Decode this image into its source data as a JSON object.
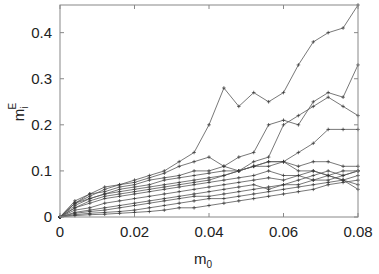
{
  "chart_data": {
    "type": "line",
    "title": "",
    "xlabel": "m_0",
    "xlabel_main": "m",
    "xlabel_sub": "0",
    "ylabel": "m_i^E",
    "ylabel_main": "m",
    "ylabel_sub": "i",
    "ylabel_sup": "E",
    "xlim": [
      0,
      0.08
    ],
    "ylim": [
      0,
      0.46
    ],
    "xticks": [
      "0",
      "0.02",
      "0.04",
      "0.06",
      "0.08"
    ],
    "xtick_values": [
      0,
      0.02,
      0.04,
      0.06,
      0.08
    ],
    "yticks": [
      "0",
      "0.1",
      "0.2",
      "0.3",
      "0.4"
    ],
    "ytick_values": [
      0,
      0.1,
      0.2,
      0.3,
      0.4
    ],
    "grid": false,
    "legend": null,
    "marker": "+",
    "line_color": "#555555",
    "x": [
      0,
      0.004,
      0.008,
      0.012,
      0.016,
      0.02,
      0.024,
      0.028,
      0.032,
      0.036,
      0.04,
      0.044,
      0.048,
      0.052,
      0.056,
      0.06,
      0.064,
      0.068,
      0.072,
      0.076,
      0.08
    ],
    "series": [
      {
        "name": "s1",
        "values": [
          0,
          0.035,
          0.05,
          0.065,
          0.07,
          0.08,
          0.09,
          0.1,
          0.12,
          0.14,
          0.2,
          0.28,
          0.24,
          0.27,
          0.25,
          0.27,
          0.33,
          0.38,
          0.4,
          0.41,
          0.46
        ]
      },
      {
        "name": "s2",
        "values": [
          0,
          0.03,
          0.045,
          0.06,
          0.07,
          0.075,
          0.085,
          0.095,
          0.11,
          0.12,
          0.13,
          0.11,
          0.13,
          0.14,
          0.2,
          0.21,
          0.2,
          0.25,
          0.27,
          0.26,
          0.33
        ]
      },
      {
        "name": "s3",
        "values": [
          0,
          0.03,
          0.05,
          0.055,
          0.065,
          0.07,
          0.08,
          0.085,
          0.09,
          0.1,
          0.1,
          0.11,
          0.1,
          0.12,
          0.13,
          0.2,
          0.22,
          0.24,
          0.26,
          0.24,
          0.22
        ]
      },
      {
        "name": "s4",
        "values": [
          0,
          0.03,
          0.04,
          0.05,
          0.06,
          0.065,
          0.07,
          0.08,
          0.085,
          0.09,
          0.095,
          0.1,
          0.1,
          0.11,
          0.12,
          0.12,
          0.14,
          0.16,
          0.19,
          0.19,
          0.19
        ]
      },
      {
        "name": "s5",
        "values": [
          0,
          0.025,
          0.04,
          0.05,
          0.055,
          0.06,
          0.065,
          0.07,
          0.075,
          0.08,
          0.085,
          0.09,
          0.1,
          0.11,
          0.12,
          0.12,
          0.11,
          0.12,
          0.12,
          0.11,
          0.11
        ]
      },
      {
        "name": "s6",
        "values": [
          0,
          0.02,
          0.035,
          0.045,
          0.05,
          0.055,
          0.06,
          0.065,
          0.07,
          0.075,
          0.08,
          0.09,
          0.1,
          0.11,
          0.11,
          0.12,
          0.1,
          0.1,
          0.09,
          0.08,
          0.07
        ]
      },
      {
        "name": "s7",
        "values": [
          0,
          0.02,
          0.03,
          0.04,
          0.045,
          0.05,
          0.055,
          0.06,
          0.065,
          0.07,
          0.075,
          0.08,
          0.085,
          0.09,
          0.1,
          0.09,
          0.09,
          0.08,
          0.09,
          0.08,
          0.06
        ]
      },
      {
        "name": "s8",
        "values": [
          0,
          0.015,
          0.02,
          0.03,
          0.035,
          0.04,
          0.045,
          0.05,
          0.055,
          0.06,
          0.065,
          0.07,
          0.075,
          0.08,
          0.085,
          0.08,
          0.09,
          0.1,
          0.09,
          0.1,
          0.1
        ]
      },
      {
        "name": "s9",
        "values": [
          0,
          0.01,
          0.015,
          0.02,
          0.025,
          0.03,
          0.035,
          0.04,
          0.045,
          0.05,
          0.055,
          0.06,
          0.065,
          0.07,
          0.06,
          0.07,
          0.08,
          0.09,
          0.1,
          0.09,
          0.1
        ]
      },
      {
        "name": "s10",
        "values": [
          0,
          0.008,
          0.012,
          0.015,
          0.02,
          0.025,
          0.03,
          0.035,
          0.04,
          0.045,
          0.045,
          0.05,
          0.055,
          0.06,
          0.065,
          0.07,
          0.07,
          0.08,
          0.08,
          0.09,
          0.1
        ]
      },
      {
        "name": "s11",
        "values": [
          0,
          0.005,
          0.008,
          0.01,
          0.012,
          0.015,
          0.02,
          0.025,
          0.03,
          0.035,
          0.04,
          0.04,
          0.045,
          0.05,
          0.055,
          0.06,
          0.065,
          0.07,
          0.075,
          0.08,
          0.09
        ]
      },
      {
        "name": "s12",
        "values": [
          0,
          0.003,
          0.005,
          0.006,
          0.008,
          0.01,
          0.012,
          0.015,
          0.02,
          0.02,
          0.025,
          0.03,
          0.035,
          0.04,
          0.045,
          0.05,
          0.055,
          0.06,
          0.07,
          0.075,
          0.08
        ]
      }
    ]
  }
}
